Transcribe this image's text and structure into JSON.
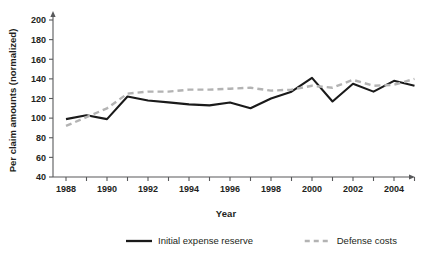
{
  "chart_data": {
    "type": "line",
    "title": "",
    "xlabel": "Year",
    "ylabel": "Per claim amounts (normalized)",
    "xlim": [
      1987.5,
      2005.5
    ],
    "ylim": [
      40,
      200
    ],
    "ytick_step": 20,
    "grid": false,
    "legend_position": "bottom",
    "x": [
      1988,
      1989,
      1990,
      1991,
      1992,
      1993,
      1994,
      1995,
      1996,
      1997,
      1998,
      1999,
      2000,
      2001,
      2002,
      2003,
      2004,
      2005
    ],
    "xtick_labels": [
      "1988",
      "1990",
      "1992",
      "1994",
      "1996",
      "1998",
      "2000",
      "2002",
      "2004"
    ],
    "ytick_labels": [
      "40",
      "60",
      "80",
      "100",
      "120",
      "140",
      "160",
      "180",
      "200"
    ],
    "series": [
      {
        "name": "Initial expense reserve",
        "style": "solid",
        "color": "#1a1a1a",
        "values": [
          99,
          103,
          99,
          122,
          118,
          116,
          114,
          113,
          116,
          110,
          120,
          127,
          141,
          117,
          135,
          127,
          138,
          133
        ]
      },
      {
        "name": "Defense costs",
        "style": "dashed",
        "color": "#b3b3b3",
        "values": [
          92,
          101,
          110,
          125,
          127,
          127,
          129,
          129,
          130,
          131,
          128,
          129,
          133,
          131,
          139,
          133,
          134,
          140
        ]
      }
    ]
  },
  "legend": {
    "items": [
      {
        "label": "Initial expense reserve",
        "style": "solid",
        "color": "#1a1a1a"
      },
      {
        "label": "Defense costs",
        "style": "dashed",
        "color": "#b3b3b3"
      }
    ]
  },
  "axes": {
    "x_title": "Year",
    "y_title": "Per claim amounts (normalized)"
  }
}
